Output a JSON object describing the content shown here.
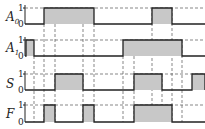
{
  "diagram": {
    "type": "timing-diagram",
    "fill_color": "#c8c8c8",
    "line_color": "#222222",
    "dash_color": "#555555",
    "x_start": 25,
    "x_end": 205,
    "signals": [
      {
        "name": "A",
        "subscript": "0",
        "label_y": 17,
        "high_y": 8,
        "low_y": 24,
        "high_label": "1",
        "low_label": "0",
        "pulses": [
          [
            44,
            94
          ],
          [
            152,
            172
          ]
        ]
      },
      {
        "name": "A",
        "subscript": "1",
        "label_y": 48,
        "high_y": 40,
        "low_y": 56,
        "high_label": "1",
        "low_label": "0",
        "pulses": [
          [
            26,
            34
          ],
          [
            123,
            182
          ]
        ]
      },
      {
        "name": "S",
        "subscript": "",
        "label_y": 84,
        "high_y": 74,
        "low_y": 90,
        "high_label": "1",
        "low_label": "0",
        "pulses": [
          [
            55,
            83
          ],
          [
            134,
            162
          ],
          [
            192,
            205
          ]
        ]
      },
      {
        "name": "F",
        "subscript": "",
        "label_y": 114,
        "high_y": 105,
        "low_y": 122,
        "high_label": "1",
        "low_label": "0",
        "pulses": [
          [
            44,
            55
          ],
          [
            83,
            94
          ],
          [
            134,
            172
          ]
        ]
      }
    ],
    "guides": [
      {
        "x": 34,
        "y1": 56,
        "y2": 122
      },
      {
        "x": 44,
        "y1": 24,
        "y2": 122
      },
      {
        "x": 55,
        "y1": 24,
        "y2": 122
      },
      {
        "x": 83,
        "y1": 24,
        "y2": 122
      },
      {
        "x": 94,
        "y1": 24,
        "y2": 122
      },
      {
        "x": 123,
        "y1": 56,
        "y2": 122
      },
      {
        "x": 134,
        "y1": 56,
        "y2": 122
      },
      {
        "x": 152,
        "y1": 8,
        "y2": 122
      },
      {
        "x": 162,
        "y1": 74,
        "y2": 122
      },
      {
        "x": 172,
        "y1": 8,
        "y2": 122
      },
      {
        "x": 182,
        "y1": 40,
        "y2": 122
      }
    ]
  }
}
